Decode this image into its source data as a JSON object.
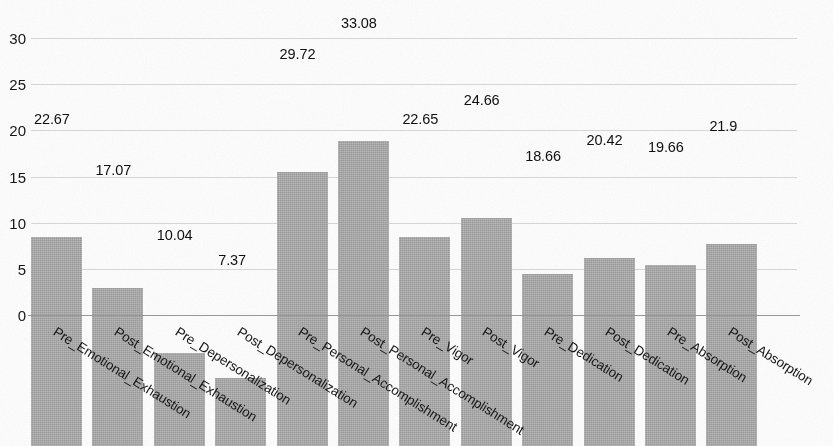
{
  "chart_data": {
    "type": "bar",
    "title": "",
    "subtitle": "",
    "xlabel": "",
    "ylabel": "",
    "ylim": [
      0,
      34
    ],
    "grid": true,
    "legend": false,
    "legend_position": "none",
    "bar_color": "#a9a9a9",
    "label_rotation_deg": -32,
    "categories": [
      "Pre_Emotional_Exhaustion",
      "Post_Emotional_Exhaustion",
      "Pre_Depersonalization",
      "Post_Depersonalization",
      "Pre_Personal_Accomplishment",
      "Post_Personal_Accomplishment",
      "Pre_Vigor",
      "Post_Vigor",
      "Pre_Dedication",
      "Post_Dedication",
      "Pre_Absorption",
      "Post_Absorption"
    ],
    "values": [
      22.67,
      17.07,
      10.04,
      7.37,
      29.72,
      33.08,
      22.65,
      24.66,
      18.66,
      20.42,
      19.66,
      21.9
    ],
    "value_labels": [
      "22.67",
      "17.07",
      "10.04",
      "7.37",
      "29.72",
      "33.08",
      "22.65",
      "24.66",
      "18.66",
      "20.42",
      "19.66",
      "21.9"
    ],
    "yticks": [
      0,
      5,
      10,
      15,
      20,
      25,
      30
    ],
    "ytick_labels": [
      "0",
      "5",
      "10",
      "15",
      "20",
      "25",
      "30"
    ]
  },
  "axes": {
    "y_axis_name": "y-axis",
    "x_axis_name": "x-axis"
  }
}
